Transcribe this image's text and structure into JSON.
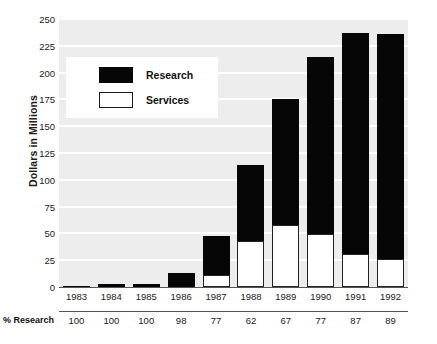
{
  "chart_data": {
    "type": "bar",
    "title": "",
    "subtitle": "",
    "xlabel": "",
    "ylabel": "Dollars in Millions",
    "ylim": [
      0,
      250
    ],
    "yticks": [
      0,
      25,
      50,
      75,
      100,
      125,
      150,
      175,
      200,
      225,
      250
    ],
    "ytick_labels": [
      "0",
      "25",
      "50",
      "75",
      "100",
      "125",
      "150",
      "175",
      "200",
      "225",
      "250"
    ],
    "grid": true,
    "legend_position": "upper-left-inside",
    "stacked": true,
    "categories": [
      "1983",
      "1984",
      "1985",
      "1986",
      "1987",
      "1988",
      "1989",
      "1990",
      "1991",
      "1992"
    ],
    "series": [
      {
        "name": "Services",
        "color": "#ffffff",
        "values": [
          0,
          0,
          0,
          0.3,
          11,
          43,
          58,
          49,
          31,
          26
        ]
      },
      {
        "name": "Research",
        "color": "#000000",
        "values": [
          1,
          3,
          3,
          12.7,
          37,
          71,
          117,
          166,
          206,
          210
        ]
      }
    ],
    "totals": [
      1,
      3,
      3,
      13,
      48,
      114,
      175,
      215,
      237,
      236
    ],
    "annotation_row": {
      "label": "% Research",
      "values": [
        "100",
        "100",
        "100",
        "98",
        "77",
        "62",
        "67",
        "77",
        "87",
        "89"
      ]
    }
  },
  "legend": {
    "items": [
      {
        "label": "Research",
        "swatch": "filled-black-swatch"
      },
      {
        "label": "Services",
        "swatch": "outlined-white-swatch"
      }
    ]
  }
}
